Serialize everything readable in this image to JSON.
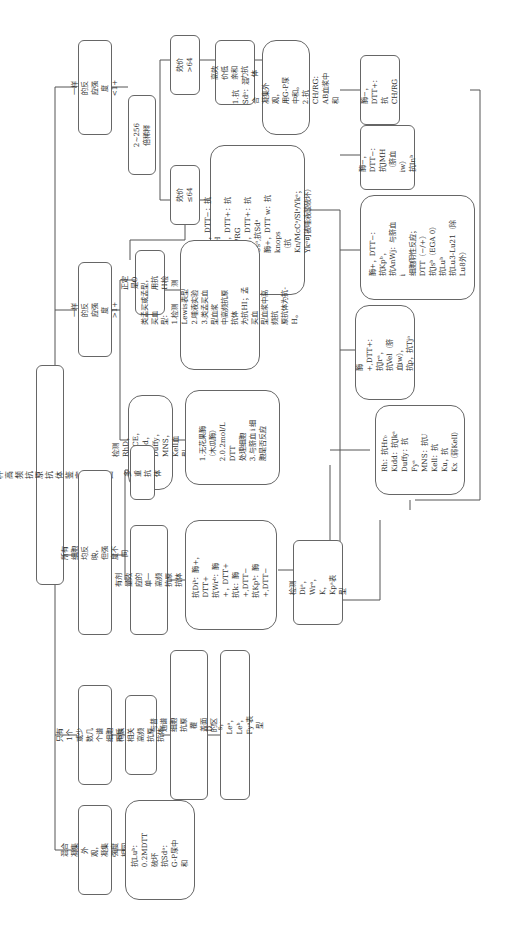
{
  "title": "同种高频抗原抗体鉴定流程图",
  "level1": [
    {
      "id": "b1",
      "label": "一样的反应强度<1+"
    },
    {
      "id": "b2",
      "label": "一样的反应强度>1+"
    },
    {
      "id": "b3",
      "label": "所有细胞均反映，但强度不同"
    },
    {
      "id": "b4",
      "label": "只有1个或少数几个谱\n细胞不反应"
    },
    {
      "id": "b5",
      "label": "混合凝集外观，\n凝集强度相同"
    }
  ],
  "branch_lt1": {
    "dilution": "2~256倍稀释",
    "titer_gt": "效价>64",
    "titer_le": "效价≤64",
    "htla": "高效价低亲和\n力抗体",
    "htla_detail": "1.抗Sdᵃ：混合\n凝集外观，\n用G-P尿中和。\n2.抗CH/RG：\nAB血浆中和",
    "titer_le_detail": "酶−，DTT−：抗JMH\n酶−，DTT+：抗CH/RG\n酶+，DTT+：抗Csᵃ,抗Sdᵃ\n酶+，DTT w：抗knops\n（抗Kn/McCᵃ/Slᵃ/Ykᵃ；\nYkᵃ可被唾液酸破坏）"
  },
  "branch_gt1": {
    "o_type": "正定是O型，\n用抗H检测",
    "bombay": "类孟买或孟买血\n型：\n1.检测 Lewis表型\n2.唾液实验\n3.类孟买血型血浆\n中高频抗原抗体\n为抗HI；孟买血\n型血浆中高频抗\n原抗体为抗-H。",
    "detect_rhd": "检测RhD，\nRhCE，Kidd，\nDuffy，MNS，\nKell血型",
    "ficin": "1.无花果酶\n（木瓜酶）\n2.0.2mol/L DTT\n处理细胞\n3.与脐血 i 细\n胞是否反应"
  },
  "branch_all": {
    "multi": "多重抗体",
    "single": "有剂量效应的单一\n高频抗原抗体",
    "anti_list": "抗Diᵇ：酶+，DTT+\n抗Wrᵇ：酶+，DTT+\n抗k：酶+,DTT−\n抗Kpᵇ：酶+,DTT−",
    "detect_di": "检测Diᵃ，\nWrᵃ，K，Kpᵃ表型"
  },
  "branch_few": {
    "race": "种族相关高频抗原\n抗体",
    "diff": "与普通谱细胞抗原覆\n盖面的区别",
    "phen": "D，s，Leᵃ，Leᵇ，Fyᵃ表型"
  },
  "branch_mixed": {
    "detail": "抗Luᵇ：0.2MDTT\n破坏\n抗Sdᵃ：G-P尿中\n和"
  },
  "right_column": [
    {
      "id": "r1",
      "label": "酶−，DTT+：\n抗CH/RG"
    },
    {
      "id": "r2",
      "label": "酶−，DTT−：\n抗JMH\n（脐血iw）\n抗Inᵇ"
    },
    {
      "id": "r3",
      "label": "酶+，DTT−：\n抗Kpᵇ，\n抗AnWj：与脐血i\n细胞阴性反应；\nDTT（−/+）\n抗Jsᵇ（EGA 0）\n抗Luᵇ\n抗Lu3-Lu21（除\nLu8外）"
    },
    {
      "id": "r4",
      "label": "酶+,DTT+：抗Jrᵃ，\n抗Vel（脐血iw），\n抗p，抗Tjᵃ"
    },
    {
      "id": "r5",
      "label": "Rh：抗Hr₀\nKidd：抗Jkᵃ\nDuffy：抗Fyᵃ\nMNS：抗U\nKell：抗Ku，抗\nKx（弱Kell）"
    }
  ]
}
